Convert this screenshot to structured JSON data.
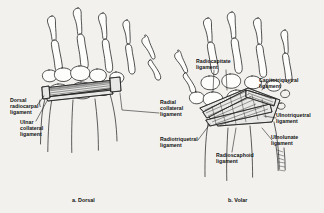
{
  "figure": {
    "background_color": "#f2f1ee",
    "ink_color": "#1a1a1a",
    "panels": [
      {
        "id": "dorsal",
        "caption": "a. Dorsal",
        "labels": [
          {
            "id": "dorsal-radiocarpal",
            "text": "Dorsal\nradiocarpal\nligament",
            "lines": [
              "Dorsal",
              "radiocarpal",
              "ligament"
            ]
          },
          {
            "id": "ulnar-collateral",
            "text": "Ulnar\ncollateral\nligament",
            "lines": [
              "Ulnar",
              "collateral",
              "ligament"
            ]
          },
          {
            "id": "radial-collateral",
            "text": "Radial\ncollateral\nligament",
            "lines": [
              "Radial",
              "collateral",
              "ligament"
            ]
          }
        ]
      },
      {
        "id": "volar",
        "caption": "b. Volar",
        "labels": [
          {
            "id": "radiocapitate",
            "text": "Radiocapitate\nligament",
            "lines": [
              "Radiocapitate",
              "ligament"
            ]
          },
          {
            "id": "capitotriquetral",
            "text": "Capitotriquetral\nligament",
            "lines": [
              "Capitotriquetral",
              "ligament"
            ]
          },
          {
            "id": "ulnotriquetral",
            "text": "Ulnotriquetral\nligament",
            "lines": [
              "Ulnotriquetral",
              "ligament"
            ]
          },
          {
            "id": "ulnolunate",
            "text": "Ulnolunate\nligament",
            "lines": [
              "Ulnolunate",
              "ligament"
            ]
          },
          {
            "id": "radiotriquetral",
            "text": "Radiotriquetral\nligament",
            "lines": [
              "Radiotriquetral",
              "ligament"
            ]
          },
          {
            "id": "radioscaphoid",
            "text": "Radioscaphoid\nligament",
            "lines": [
              "Radioscaphoid",
              "ligament"
            ]
          }
        ]
      }
    ]
  },
  "text": {
    "dorsal_radiocarpal_1": "Dorsal",
    "dorsal_radiocarpal_2": "radiocarpal",
    "dorsal_radiocarpal_3": "ligament",
    "ulnar_collateral_1": "Ulnar",
    "ulnar_collateral_2": "collateral",
    "ulnar_collateral_3": "ligament",
    "radial_collateral_1": "Radial",
    "radial_collateral_2": "collateral",
    "radial_collateral_3": "ligament",
    "radiocapitate_1": "Radiocapitate",
    "radiocapitate_2": "ligament",
    "capitotriquetral_1": "Capitotriquetral",
    "capitotriquetral_2": "ligament",
    "ulnotriquetral_1": "Ulnotriquetral",
    "ulnotriquetral_2": "ligament",
    "ulnolunate_1": "Ulnolunate",
    "ulnolunate_2": "ligament",
    "radiotriquetral_1": "Radiotriquetral",
    "radiotriquetral_2": "ligament",
    "radioscaphoid_1": "Radioscaphoid",
    "radioscaphoid_2": "ligament",
    "caption_dorsal": "a. Dorsal",
    "caption_volar": "b. Volar"
  }
}
